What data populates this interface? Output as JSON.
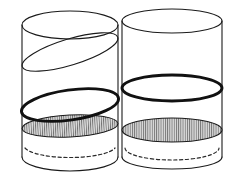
{
  "figure": {
    "canvas": {
      "width": 240,
      "height": 184,
      "background": "#ffffff"
    },
    "colors": {
      "outline": "#1a1a1a",
      "emphasis": "#111111",
      "hidden_edge": "#2a2a2a",
      "hatch": "#5a5a5a",
      "shade_base": "#d8d8d8",
      "background": "#ffffff"
    },
    "stroke_widths": {
      "thin": 1.1,
      "thick": 2.9,
      "dashed": 1.2
    },
    "left_cylinder": {
      "name": "left-cylinder",
      "axis_x": 70,
      "radius_x": 48,
      "radius_y": 14,
      "wall_left_x": 22,
      "wall_right_x": 118,
      "top_rim_cy": 25,
      "bottom_rim_cy": 157,
      "sections": [
        {
          "name": "top-rim-ellipse",
          "style": "thin",
          "cy": 25,
          "tilt_deg": 0
        },
        {
          "name": "tilted-section-ellipse",
          "style": "thin",
          "cy": 52,
          "tilt_deg": -17
        },
        {
          "name": "emphasized-section-ellipse",
          "style": "thick",
          "cy": 105,
          "tilt_deg": -8
        },
        {
          "name": "hatched-section-ellipse",
          "style": "hatched",
          "cy": 126,
          "tilt_deg": -3
        },
        {
          "name": "hidden-bottom-back-arc",
          "style": "dashed",
          "cy": 148,
          "tilt_deg": 0
        },
        {
          "name": "bottom-front-arc",
          "style": "thin",
          "cy": 157,
          "tilt_deg": 0
        }
      ]
    },
    "right_cylinder": {
      "name": "right-cylinder",
      "axis_x": 172,
      "radius_x": 50,
      "radius_y": 12,
      "wall_left_x": 122,
      "wall_right_x": 222,
      "top_rim_cy": 21,
      "bottom_rim_cy": 157,
      "sections": [
        {
          "name": "top-rim-ellipse",
          "style": "thin",
          "cy": 21,
          "tilt_deg": 0
        },
        {
          "name": "emphasized-section-ellipse",
          "style": "thick",
          "cy": 88,
          "tilt_deg": 0
        },
        {
          "name": "hatched-section-ellipse",
          "style": "hatched",
          "cy": 130,
          "tilt_deg": 0
        },
        {
          "name": "hidden-bottom-back-arc",
          "style": "dashed",
          "cy": 148,
          "tilt_deg": 0
        },
        {
          "name": "bottom-front-arc",
          "style": "thin",
          "cy": 157,
          "tilt_deg": 0
        }
      ]
    },
    "labels": {
      "has_text_labels": false,
      "text_items": []
    }
  }
}
